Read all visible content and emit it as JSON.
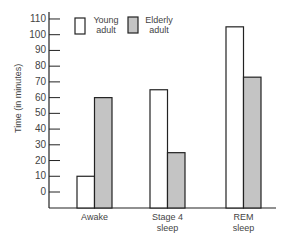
{
  "chart_data": {
    "type": "bar",
    "title": "",
    "xlabel": "",
    "ylabel": "Time (in minutes)",
    "categories": [
      "Awake",
      "Stage 4 sleep",
      "REM sleep"
    ],
    "category_lines": [
      [
        "Awake"
      ],
      [
        "Stage 4",
        "sleep"
      ],
      [
        "REM",
        "sleep"
      ]
    ],
    "series": [
      {
        "name": "Young adult",
        "name_lines": [
          "Young",
          "adult"
        ],
        "color": "#ffffff",
        "values": [
          10,
          65,
          105
        ]
      },
      {
        "name": "Elderly adult",
        "name_lines": [
          "Elderly",
          "adult"
        ],
        "color": "#c4c4c4",
        "values": [
          60,
          25,
          73
        ]
      }
    ],
    "yticks": [
      0,
      10,
      20,
      30,
      40,
      50,
      60,
      70,
      80,
      90,
      100,
      110
    ],
    "ylim": [
      0,
      110
    ],
    "grid": false,
    "legend_position": "top-left inside plot"
  },
  "colors": {
    "axis": "#222222",
    "bar_edge": "#222222",
    "text": "#444444"
  }
}
